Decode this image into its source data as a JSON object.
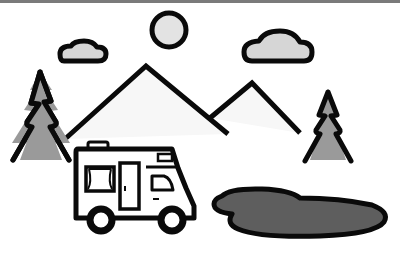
{
  "illustration": {
    "subject": "camper van by a pond in the mountains",
    "elements": [
      "sun",
      "cloud-left",
      "cloud-right",
      "mountain-large",
      "mountain-small",
      "tree-left",
      "tree-right",
      "camper-van",
      "pond"
    ]
  },
  "colors": {
    "outline": "#0a0a0a",
    "sun_fill": "#e3e3e3",
    "cloud_fill": "#d6d6d6",
    "mountain_fill": "#f6f6f6",
    "tree_fill": "#9a9a9a",
    "pond_fill": "#5e5e5e",
    "van_fill": "#ffffff",
    "border": "#7a7a7a"
  }
}
